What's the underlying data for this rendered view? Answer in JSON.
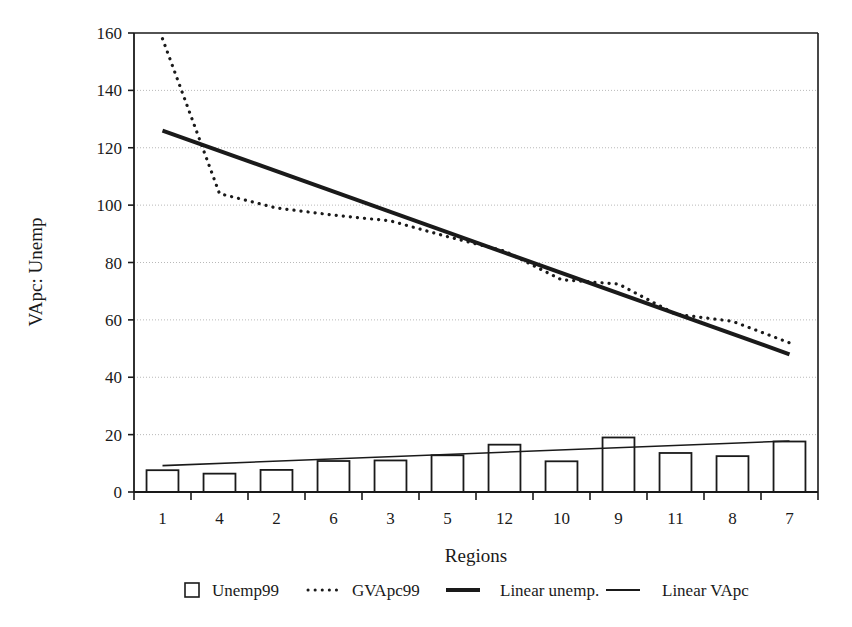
{
  "chart_data": {
    "type": "bar",
    "title": "",
    "xlabel": "Regions",
    "ylabel": "VApc: Unemp",
    "categories": [
      "1",
      "4",
      "2",
      "6",
      "3",
      "5",
      "12",
      "10",
      "9",
      "11",
      "8",
      "7"
    ],
    "ylim": [
      0,
      160
    ],
    "ytick_step": 20,
    "yticks": [
      "0",
      "20",
      "40",
      "60",
      "80",
      "100",
      "120",
      "140",
      "160"
    ],
    "grid": "horizontal-dotted",
    "legend_position": "bottom",
    "series": [
      {
        "name": "Unemp99",
        "type": "bar",
        "marker": "open-square",
        "values": [
          7.6,
          6.4,
          7.7,
          10.8,
          11.0,
          12.8,
          16.5,
          10.7,
          19.0,
          13.6,
          12.5,
          17.6
        ]
      },
      {
        "name": "GVApc99",
        "type": "line",
        "style": "dotted",
        "values": [
          158.0,
          104.0,
          99.0,
          96.5,
          94.5,
          89.0,
          84.0,
          74.0,
          72.5,
          62.0,
          59.5,
          52.0
        ]
      },
      {
        "name": "Linear unemp.",
        "type": "trendline",
        "style": "thick-solid",
        "values": [
          126.0,
          118.9,
          111.8,
          104.7,
          97.6,
          90.5,
          83.4,
          76.4,
          69.3,
          62.2,
          55.1,
          48.0
        ]
      },
      {
        "name": "Linear VApc",
        "type": "trendline",
        "style": "thin-solid",
        "values": [
          9.2,
          10.0,
          10.8,
          11.5,
          12.3,
          13.1,
          13.9,
          14.7,
          15.4,
          16.2,
          17.0,
          17.8
        ]
      }
    ]
  },
  "legend": {
    "items": [
      {
        "label": "Unemp99",
        "marker": "open-square"
      },
      {
        "label": "GVApc99",
        "marker": "dotted-line"
      },
      {
        "label": "Linear unemp.",
        "marker": "thick-line"
      },
      {
        "label": "Linear VApc",
        "marker": "thin-line"
      }
    ]
  },
  "colors": {
    "ink": "#1a1a1a",
    "grid": "#b9b9b9",
    "background": "#ffffff"
  }
}
